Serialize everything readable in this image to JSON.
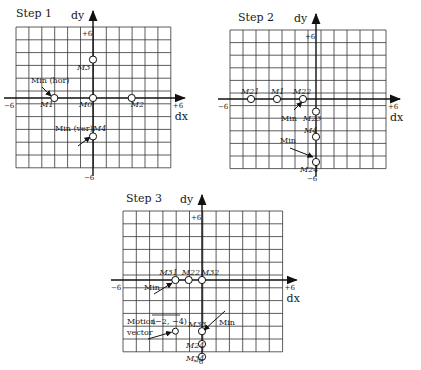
{
  "figure": {
    "panels": [
      {
        "id": "step1",
        "title": "Step 1",
        "axis_labels": {
          "x": "dx",
          "y": "dy"
        },
        "ticks": {
          "x_min": "−6",
          "x_max": "+6",
          "y_max": "+6",
          "y_min": "−6"
        },
        "points": [
          {
            "label": "M0",
            "dx": 0,
            "dy": 0
          },
          {
            "label": "M1",
            "dx": -3,
            "dy": 0
          },
          {
            "label": "M2",
            "dx": 3,
            "dy": 0
          },
          {
            "label": "M3",
            "dx": 0,
            "dy": 3
          },
          {
            "label": "M4",
            "dx": 0,
            "dy": -3
          }
        ],
        "annotations": [
          {
            "text": "Min (hor)",
            "target": "M1"
          },
          {
            "text": "Min (ver)",
            "target": "M4"
          }
        ]
      },
      {
        "id": "step2",
        "title": "Step 2",
        "axis_labels": {
          "x": "dx",
          "y": "dy"
        },
        "ticks": {
          "x_min": "−6",
          "x_max": "+6",
          "y_max": "+6",
          "y_min": "−6"
        },
        "points": [
          {
            "label": "M21",
            "dx": -5,
            "dy": 0
          },
          {
            "label": "M1",
            "dx": -3,
            "dy": 0
          },
          {
            "label": "M22",
            "dx": -1,
            "dy": 0
          },
          {
            "label": "M23",
            "dx": 0,
            "dy": -1
          },
          {
            "label": "M4",
            "dx": 0,
            "dy": -3
          },
          {
            "label": "M24",
            "dx": 0,
            "dy": -5
          }
        ],
        "annotations": [
          {
            "text": "Min",
            "target": "M22",
            "suffix_label": "M23"
          },
          {
            "text": "Min",
            "target": "M24"
          }
        ]
      },
      {
        "id": "step3",
        "title": "Step 3",
        "axis_labels": {
          "x": "dx",
          "y": "dy"
        },
        "ticks": {
          "x_min": "−6",
          "x_max": "+6",
          "y_max": "+6",
          "y_min": "−6"
        },
        "points": [
          {
            "label": "M31",
            "dx": -2,
            "dy": 0
          },
          {
            "label": "M22",
            "dx": -1,
            "dy": 0
          },
          {
            "label": "M32",
            "dx": 0,
            "dy": 0
          },
          {
            "label": "M33",
            "dx": 0,
            "dy": -4
          },
          {
            "label": "M24",
            "dx": 0,
            "dy": -5
          },
          {
            "label": "M34",
            "dx": 0,
            "dy": -6
          }
        ],
        "annotations": [
          {
            "text": "Min",
            "target": "M31"
          },
          {
            "text": "Min",
            "target": "M33"
          },
          {
            "text_line1": "Motion",
            "text_line2": "vector",
            "value": "(−2, −4)",
            "target_dx": -2,
            "target_dy": -4
          }
        ]
      }
    ]
  }
}
